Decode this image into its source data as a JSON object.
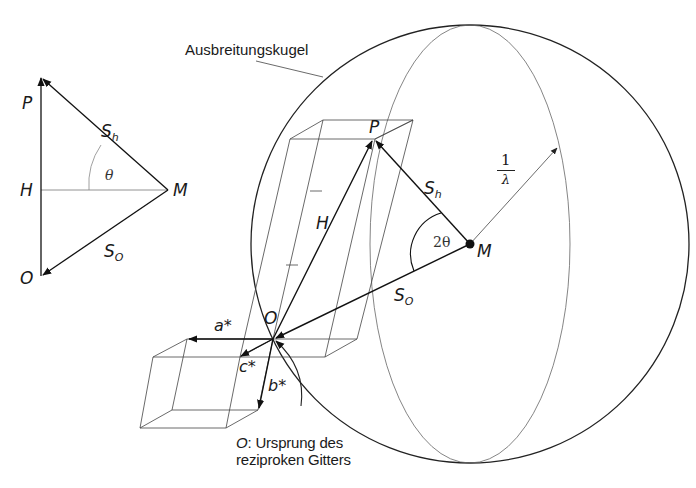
{
  "diagram": {
    "sphere_label": "Ausbreitungskugel",
    "small_triangle": {
      "points": {
        "P": "P",
        "H": "H",
        "M": "M",
        "O": "O"
      },
      "vector_labels": {
        "s_h": {
          "main": "S",
          "sub": "h"
        },
        "s_o": {
          "main": "S",
          "sub": "O"
        }
      },
      "angle_label": "θ"
    },
    "main": {
      "points": {
        "P": "P",
        "M": "M",
        "O": "O"
      },
      "vector_labels": {
        "H": "H",
        "s_h": {
          "main": "S",
          "sub": "h"
        },
        "s_o": {
          "main": "S",
          "sub": "O"
        }
      },
      "angle_label": "2θ",
      "radius_label": {
        "numerator": "1",
        "denominator": "λ"
      },
      "axes": {
        "a": "a*",
        "b": "b*",
        "c": "c*"
      }
    },
    "caption": {
      "origin_symbol": "O",
      "line1_rest": ": Ursprung des",
      "line2": "reziproken Gitters"
    },
    "colors": {
      "stroke_dark": "#1a1a1a",
      "stroke_light": "#555555",
      "background": "#ffffff"
    }
  }
}
